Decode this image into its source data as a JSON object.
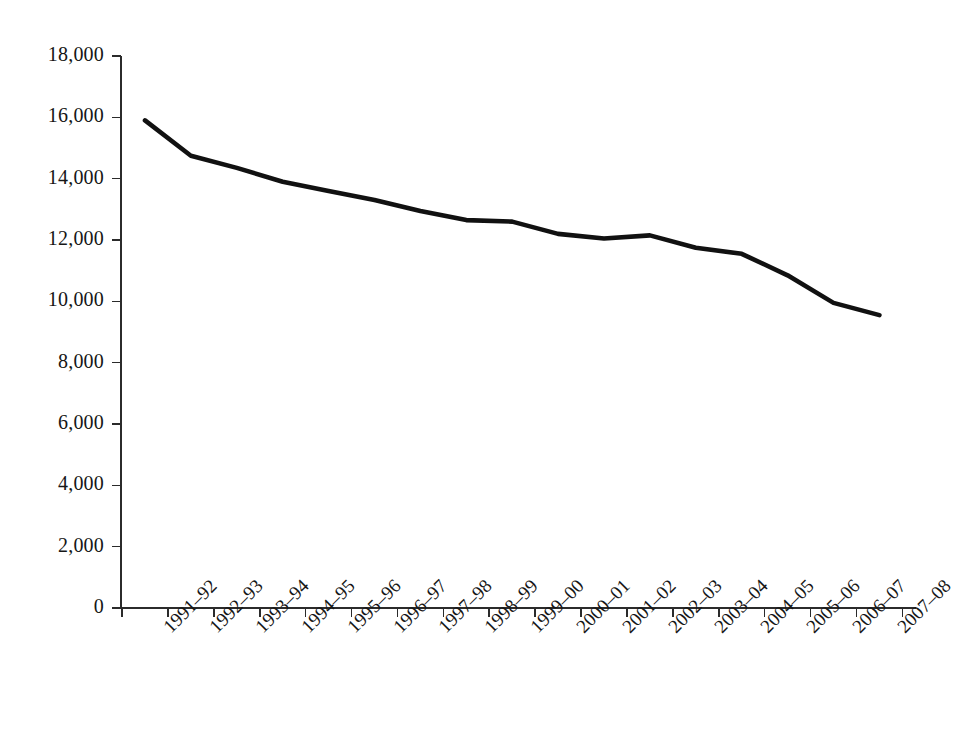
{
  "chart_data": {
    "type": "line",
    "title": "",
    "subtitle": "",
    "xlabel": "",
    "ylabel": "",
    "grid": false,
    "legend": false,
    "legend_position": "none",
    "ylim": [
      0,
      18000
    ],
    "ytick_step": 2000,
    "line_color": "#111111",
    "categories": [
      "1991–92",
      "1992–93",
      "1993–94",
      "1994–95",
      "1995–96",
      "1996–97",
      "1997–98",
      "1998–99",
      "1999–00",
      "2000–01",
      "2001–02",
      "2002–03",
      "2003–04",
      "2004–05",
      "2005–06",
      "2006–07",
      "2007–08"
    ],
    "values": [
      15900,
      14750,
      14350,
      13900,
      13600,
      13300,
      12950,
      12650,
      12600,
      12200,
      12050,
      12150,
      11750,
      11550,
      10850,
      9950,
      9550
    ],
    "ytick_labels": [
      "0",
      "2,000",
      "4,000",
      "6,000",
      "8,000",
      "10,000",
      "12,000",
      "14,000",
      "16,000",
      "18,000"
    ],
    "ytick_values": [
      0,
      2000,
      4000,
      6000,
      8000,
      10000,
      12000,
      14000,
      16000,
      18000
    ]
  }
}
